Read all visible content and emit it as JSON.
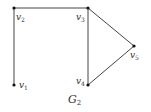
{
  "graph": {
    "title": "G",
    "title_sub": "2",
    "vertices": [
      {
        "id": "v1",
        "name": "v",
        "sub": "1",
        "x": 14,
        "y": 85,
        "lx": 19,
        "ly": 88
      },
      {
        "id": "v2",
        "name": "v",
        "sub": "2",
        "x": 14,
        "y": 8,
        "lx": 16,
        "ly": 20
      },
      {
        "id": "v3",
        "name": "v",
        "sub": "3",
        "x": 88,
        "y": 8,
        "lx": 76,
        "ly": 20
      },
      {
        "id": "v4",
        "name": "v",
        "sub": "4",
        "x": 88,
        "y": 85,
        "lx": 76,
        "ly": 84
      },
      {
        "id": "v5",
        "name": "v",
        "sub": "5",
        "x": 134,
        "y": 46,
        "lx": 130,
        "ly": 58
      }
    ],
    "edges": [
      [
        "v1",
        "v2"
      ],
      [
        "v2",
        "v3"
      ],
      [
        "v3",
        "v4"
      ],
      [
        "v3",
        "v5"
      ],
      [
        "v4",
        "v5"
      ]
    ],
    "colors": {
      "edge": "#444444",
      "node": "#111111",
      "label": "#333333"
    }
  }
}
